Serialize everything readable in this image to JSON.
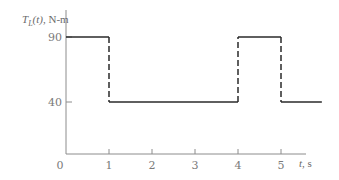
{
  "chart_data": {
    "type": "line",
    "title": "",
    "ylabel_parts": {
      "symbol": "T",
      "subscript": "L",
      "arg": "(t)",
      "unit": ", N-m"
    },
    "ylabel": "T_L(t), N-m",
    "xlabel": "t, s",
    "xlabel_parts": {
      "var": "t",
      "unit": ", s"
    },
    "x_ticks": [
      0,
      1,
      2,
      3,
      4,
      5
    ],
    "y_ticks": [
      0,
      40,
      90
    ],
    "xlim": [
      0,
      6
    ],
    "ylim": [
      0,
      100
    ],
    "grid": false,
    "legend": null,
    "series": [
      {
        "name": "T_L(t)",
        "style": "step",
        "segments": [
          {
            "t0": 0,
            "t1": 1,
            "value": 90
          },
          {
            "t0": 1,
            "t1": 4,
            "value": 40
          },
          {
            "t0": 4,
            "t1": 5,
            "value": 90
          },
          {
            "t0": 5,
            "t1": 5.95,
            "value": 40
          }
        ],
        "transitions": [
          {
            "t": 1,
            "from": 90,
            "to": 40,
            "line": "dashed"
          },
          {
            "t": 4,
            "from": 40,
            "to": 90,
            "line": "dashed"
          },
          {
            "t": 5,
            "from": 90,
            "to": 40,
            "line": "dashed"
          }
        ]
      }
    ]
  },
  "colors": {
    "axis": "#8c8c8c",
    "series": "#2a2a2a",
    "text": "#7a7a7a"
  }
}
